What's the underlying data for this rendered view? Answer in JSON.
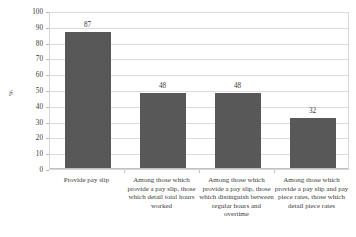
{
  "chart_data": {
    "type": "bar",
    "title": "",
    "xlabel": "",
    "ylabel": "%",
    "ylim": [
      0,
      100
    ],
    "ytick_step": 10,
    "grid": true,
    "legend": false,
    "bar_color": "#585858",
    "gridline_color": "#dcdcdc",
    "plot_border_color": "#d6d6d6",
    "categories": [
      "Provide pay slip",
      "Among those which provide a pay slip, those which detail total hours worked",
      "Among those which provide a pay slip, those which distinguish between regular hours and overtime",
      "Among those which provide a pay slip and pay piece rates, those which detail piece rates"
    ],
    "values": [
      87,
      48,
      48,
      32
    ],
    "value_labels": [
      "87",
      "48",
      "48",
      "32"
    ],
    "yticks": [
      "0",
      "10",
      "20",
      "30",
      "40",
      "50",
      "60",
      "70",
      "80",
      "90",
      "100"
    ]
  }
}
